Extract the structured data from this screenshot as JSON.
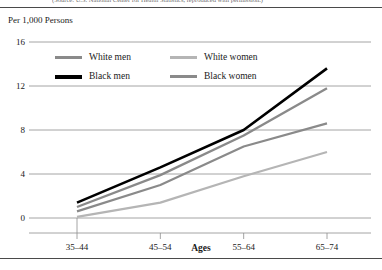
{
  "figure": {
    "top_caption": "(Source: U.S. National Center for Health Statistics, reproduced with permission.)",
    "unit_label": "Per 1,000 Persons"
  },
  "legend": {
    "rows": [
      [
        {
          "label": "White men",
          "color": "#8a8a8a",
          "weight": "normal"
        },
        {
          "label": "White women",
          "color": "#b5b5b5",
          "weight": "normal"
        }
      ],
      [
        {
          "label": "Black men",
          "color": "#000000",
          "weight": "thick"
        },
        {
          "label": "Black women",
          "color": "#8a8a8a",
          "weight": "normal"
        }
      ]
    ]
  },
  "chart_data": {
    "type": "line",
    "title": "",
    "xlabel": "Ages",
    "ylabel": "Per 1,000 Persons",
    "categories": [
      "35–44",
      "45–54",
      "55–64",
      "65–74"
    ],
    "ylim": [
      0,
      16
    ],
    "yticks": [
      0,
      4,
      8,
      12,
      16
    ],
    "grid": true,
    "legend_position": "upper-left",
    "series": [
      {
        "name": "Black men",
        "color": "#000000",
        "width": 2.6,
        "values": [
          1.4,
          4.6,
          8.0,
          13.6
        ]
      },
      {
        "name": "White men",
        "color": "#8a8a8a",
        "width": 2.4,
        "values": [
          1.0,
          3.9,
          7.5,
          11.8
        ]
      },
      {
        "name": "Black women",
        "color": "#8a8a8a",
        "width": 2.2,
        "values": [
          0.6,
          3.0,
          6.5,
          8.6
        ]
      },
      {
        "name": "White women",
        "color": "#b5b5b5",
        "width": 2.2,
        "values": [
          0.1,
          1.4,
          3.8,
          6.0
        ]
      }
    ]
  }
}
